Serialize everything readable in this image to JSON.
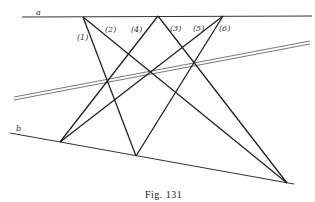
{
  "figure": {
    "caption": "Fig. 131",
    "line_a_label": "a",
    "line_b_label": "b",
    "line_labels": [
      "(1)",
      "(2)",
      "(4)",
      "(3)",
      "(5)",
      "(6)"
    ],
    "colors": {
      "ink": "#222222",
      "background": "#ffffff"
    }
  }
}
